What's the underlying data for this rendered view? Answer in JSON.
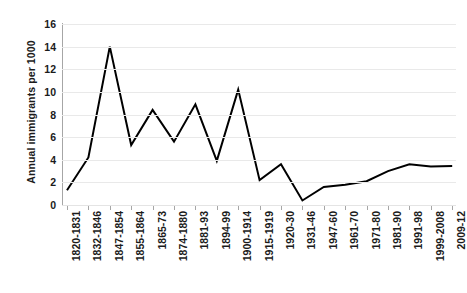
{
  "chart_data": {
    "type": "line",
    "title": "",
    "xlabel": "",
    "ylabel": "Annual immigrants per 1000",
    "ylim": [
      0,
      16
    ],
    "yticks": [
      0,
      2,
      4,
      6,
      8,
      10,
      12,
      14,
      16
    ],
    "grid": "horizontal",
    "legend": "none",
    "line_color": "#000000",
    "gridline_color": "#e9e9e9",
    "axis_color": "#a6a6a6",
    "categories": [
      "1820-1831",
      "1832-1846",
      "1847-1854",
      "1855-1864",
      "1865-73",
      "1874-1880",
      "1881-93",
      "1894-99",
      "1900-1914",
      "1915-1919",
      "1920-30",
      "1931-46",
      "1947-60",
      "1961-70",
      "1971-80",
      "1981-90",
      "1991-98",
      "1999-2008",
      "2009-12"
    ],
    "values": [
      1.3,
      4.2,
      14.0,
      5.3,
      8.4,
      5.6,
      8.9,
      3.9,
      10.2,
      2.2,
      3.6,
      0.4,
      1.6,
      1.8,
      2.1,
      3.0,
      3.6,
      3.4,
      3.45
    ]
  }
}
